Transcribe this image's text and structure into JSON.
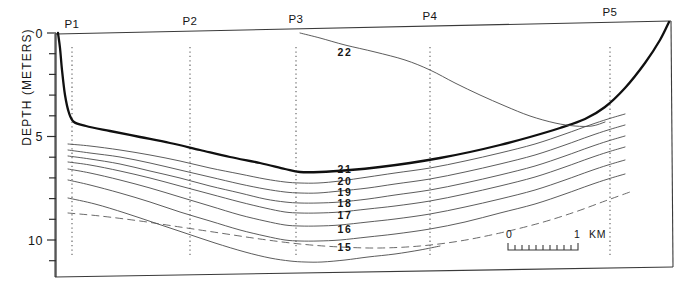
{
  "figure": {
    "type": "oceanographic-cross-section",
    "y_axis_label": "DEPTH  (METERS)",
    "y_axis_ticks": [
      "0",
      "5",
      "10"
    ],
    "y_axis_tick_values": [
      0,
      5,
      10
    ],
    "y_axis_minor_interval_m": 1,
    "y_axis_range_m": [
      0,
      11
    ],
    "stations": [
      {
        "label": "P1",
        "x_px": 72
      },
      {
        "label": "P2",
        "x_px": 190
      },
      {
        "label": "P3",
        "x_px": 296
      },
      {
        "label": "P4",
        "x_px": 430
      },
      {
        "label": "P5",
        "x_px": 610
      }
    ],
    "contour_labels": [
      "22",
      "21",
      "20",
      "19",
      "18",
      "17",
      "16",
      "15"
    ],
    "scale_bar": {
      "start_label": "0",
      "end_label": "1",
      "unit_label": "KM",
      "divisions": 10
    },
    "colors": {
      "seabed": "#101010",
      "isoline": "#4a4a4a",
      "frame": "#3a3a3a",
      "station_line": "#6a6a6a",
      "text": "#161616",
      "background": "#ffffff"
    }
  },
  "chart_data": {
    "type": "line",
    "title": "",
    "xlabel": "",
    "ylabel": "DEPTH  (METERS)",
    "ylim": [
      11,
      0
    ],
    "y_inverted": true,
    "grid": false,
    "legend": "none",
    "x_unit": "km",
    "annotations": [
      "P1",
      "P2",
      "P3",
      "P4",
      "P5",
      "22",
      "21",
      "20",
      "19",
      "18",
      "17",
      "16",
      "15"
    ],
    "series": [
      {
        "name": "seabed",
        "kind": "bathymetry-bold",
        "style": "solid-bold",
        "points_px": [
          [
            58,
            33
          ],
          [
            60,
            48
          ],
          [
            62,
            70
          ],
          [
            65,
            95
          ],
          [
            69,
            113
          ],
          [
            74,
            122
          ],
          [
            86,
            126
          ],
          [
            110,
            131
          ],
          [
            140,
            137
          ],
          [
            170,
            143
          ],
          [
            200,
            150
          ],
          [
            230,
            157
          ],
          [
            260,
            163
          ],
          [
            285,
            169
          ],
          [
            300,
            172
          ],
          [
            320,
            172
          ],
          [
            350,
            170
          ],
          [
            380,
            167
          ],
          [
            410,
            163
          ],
          [
            440,
            158
          ],
          [
            470,
            152
          ],
          [
            500,
            145
          ],
          [
            530,
            137
          ],
          [
            560,
            128
          ],
          [
            585,
            119
          ],
          [
            605,
            107
          ],
          [
            625,
            88
          ],
          [
            645,
            63
          ],
          [
            660,
            40
          ],
          [
            669,
            22
          ]
        ]
      },
      {
        "name": "22",
        "label": "22",
        "style": "solid",
        "label_px": [
          345,
          52
        ],
        "points_px": [
          [
            300,
            33
          ],
          [
            320,
            38
          ],
          [
            345,
            45
          ],
          [
            375,
            52
          ],
          [
            405,
            60
          ],
          [
            430,
            70
          ],
          [
            455,
            83
          ],
          [
            480,
            95
          ],
          [
            505,
            106
          ],
          [
            530,
            116
          ],
          [
            555,
            123
          ],
          [
            575,
            126
          ],
          [
            592,
            126
          ],
          [
            605,
            122
          ]
        ]
      },
      {
        "name": "21",
        "label": "21",
        "style": "solid",
        "label_px": [
          345,
          169
        ],
        "points_px": [
          [
            68,
            144
          ],
          [
            90,
            146
          ],
          [
            120,
            150
          ],
          [
            150,
            155
          ],
          [
            180,
            161
          ],
          [
            210,
            168
          ],
          [
            240,
            174
          ],
          [
            265,
            179
          ],
          [
            285,
            182
          ],
          [
            300,
            183
          ],
          [
            318,
            183
          ],
          [
            340,
            181
          ],
          [
            368,
            177
          ],
          [
            395,
            173
          ],
          [
            430,
            168
          ],
          [
            465,
            161
          ],
          [
            500,
            153
          ],
          [
            535,
            144
          ],
          [
            565,
            134
          ],
          [
            590,
            125
          ],
          [
            608,
            119
          ],
          [
            625,
            114
          ]
        ]
      },
      {
        "name": "20",
        "label": "20",
        "style": "solid",
        "label_px": [
          345,
          181
        ],
        "points_px": [
          [
            68,
            150
          ],
          [
            90,
            153
          ],
          [
            120,
            157
          ],
          [
            150,
            163
          ],
          [
            180,
            170
          ],
          [
            210,
            177
          ],
          [
            240,
            184
          ],
          [
            265,
            189
          ],
          [
            285,
            192
          ],
          [
            300,
            193
          ],
          [
            318,
            193
          ],
          [
            340,
            191
          ],
          [
            368,
            188
          ],
          [
            395,
            184
          ],
          [
            430,
            179
          ],
          [
            465,
            172
          ],
          [
            500,
            164
          ],
          [
            535,
            155
          ],
          [
            565,
            145
          ],
          [
            590,
            136
          ],
          [
            608,
            130
          ],
          [
            625,
            125
          ]
        ]
      },
      {
        "name": "19",
        "label": "19",
        "style": "solid",
        "label_px": [
          345,
          192
        ],
        "points_px": [
          [
            68,
            156
          ],
          [
            90,
            159
          ],
          [
            120,
            164
          ],
          [
            150,
            171
          ],
          [
            180,
            178
          ],
          [
            210,
            186
          ],
          [
            240,
            193
          ],
          [
            265,
            199
          ],
          [
            285,
            202
          ],
          [
            300,
            203
          ],
          [
            318,
            203
          ],
          [
            340,
            202
          ],
          [
            368,
            199
          ],
          [
            395,
            195
          ],
          [
            430,
            190
          ],
          [
            465,
            183
          ],
          [
            500,
            175
          ],
          [
            535,
            166
          ],
          [
            565,
            156
          ],
          [
            590,
            147
          ],
          [
            608,
            141
          ],
          [
            625,
            136
          ]
        ]
      },
      {
        "name": "18",
        "label": "18",
        "style": "solid",
        "label_px": [
          345,
          203
        ],
        "points_px": [
          [
            68,
            162
          ],
          [
            90,
            165
          ],
          [
            120,
            171
          ],
          [
            150,
            178
          ],
          [
            180,
            186
          ],
          [
            210,
            194
          ],
          [
            240,
            202
          ],
          [
            265,
            208
          ],
          [
            285,
            212
          ],
          [
            300,
            213
          ],
          [
            318,
            213
          ],
          [
            340,
            212
          ],
          [
            368,
            209
          ],
          [
            395,
            206
          ],
          [
            430,
            201
          ],
          [
            465,
            194
          ],
          [
            500,
            186
          ],
          [
            535,
            177
          ],
          [
            565,
            167
          ],
          [
            590,
            158
          ],
          [
            608,
            152
          ],
          [
            625,
            147
          ]
        ]
      },
      {
        "name": "17",
        "label": "17",
        "style": "solid",
        "label_px": [
          345,
          215
        ],
        "points_px": [
          [
            68,
            169
          ],
          [
            90,
            173
          ],
          [
            120,
            180
          ],
          [
            150,
            188
          ],
          [
            180,
            197
          ],
          [
            210,
            206
          ],
          [
            240,
            215
          ],
          [
            265,
            221
          ],
          [
            285,
            225
          ],
          [
            300,
            226
          ],
          [
            318,
            226
          ],
          [
            340,
            225
          ],
          [
            368,
            222
          ],
          [
            395,
            219
          ],
          [
            430,
            214
          ],
          [
            465,
            207
          ],
          [
            500,
            199
          ],
          [
            535,
            190
          ],
          [
            565,
            180
          ],
          [
            590,
            171
          ],
          [
            608,
            165
          ],
          [
            625,
            160
          ]
        ]
      },
      {
        "name": "16",
        "label": "16",
        "style": "solid",
        "label_px": [
          345,
          229
        ],
        "points_px": [
          [
            68,
            180
          ],
          [
            90,
            185
          ],
          [
            120,
            193
          ],
          [
            150,
            202
          ],
          [
            180,
            212
          ],
          [
            210,
            221
          ],
          [
            240,
            230
          ],
          [
            265,
            236
          ],
          [
            285,
            240
          ],
          [
            300,
            241
          ],
          [
            318,
            241
          ],
          [
            340,
            240
          ],
          [
            368,
            237
          ],
          [
            395,
            234
          ],
          [
            430,
            229
          ],
          [
            465,
            222
          ],
          [
            500,
            213
          ],
          [
            535,
            204
          ],
          [
            565,
            194
          ],
          [
            590,
            185
          ],
          [
            608,
            179
          ],
          [
            625,
            174
          ]
        ]
      },
      {
        "name": "15",
        "label": "15",
        "style": "solid",
        "label_px": [
          345,
          247
        ],
        "points_px": [
          [
            68,
            198
          ],
          [
            95,
            204
          ],
          [
            125,
            213
          ],
          [
            155,
            223
          ],
          [
            185,
            233
          ],
          [
            215,
            243
          ],
          [
            245,
            252
          ],
          [
            270,
            258
          ],
          [
            290,
            261
          ],
          [
            305,
            262
          ],
          [
            322,
            262
          ],
          [
            345,
            260
          ],
          [
            368,
            257
          ],
          [
            395,
            254
          ],
          [
            420,
            250
          ],
          [
            440,
            246
          ]
        ]
      },
      {
        "name": "14-dashed",
        "style": "dashed",
        "points_px": [
          [
            68,
            213
          ],
          [
            100,
            216
          ],
          [
            140,
            221
          ],
          [
            180,
            227
          ],
          [
            220,
            233
          ],
          [
            260,
            239
          ],
          [
            300,
            244
          ],
          [
            340,
            247
          ],
          [
            380,
            248
          ],
          [
            420,
            246
          ],
          [
            460,
            241
          ],
          [
            500,
            233
          ],
          [
            540,
            223
          ],
          [
            575,
            212
          ],
          [
            605,
            201
          ],
          [
            630,
            192
          ]
        ]
      }
    ]
  }
}
